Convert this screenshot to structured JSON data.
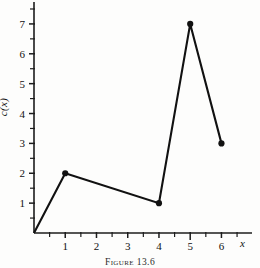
{
  "figure": {
    "caption_prefix": "Figure",
    "caption_number": "13.6",
    "caption_full": "Figure 13.6"
  },
  "axes": {
    "x_axis_name": "x",
    "y_axis_name": "c(x)",
    "x_ticks": [
      "1",
      "2",
      "3",
      "4",
      "5",
      "6"
    ],
    "y_ticks": [
      "1",
      "2",
      "3",
      "4",
      "5",
      "6",
      "7"
    ],
    "x_tick_values": [
      1,
      2,
      3,
      4,
      5,
      6
    ],
    "y_tick_values": [
      1,
      2,
      3,
      4,
      5,
      6,
      7
    ],
    "x_minor_step": 0.5,
    "y_minor_step": 0.5,
    "xlim": [
      0,
      6.85
    ],
    "ylim": [
      0,
      7.6
    ]
  },
  "chart_data": {
    "type": "line",
    "xlabel": "x",
    "ylabel": "c(x)",
    "x": [
      0,
      1,
      4,
      5,
      6
    ],
    "values": [
      0,
      2,
      1,
      7,
      3
    ],
    "points": [
      {
        "x": 0,
        "y": 0,
        "marker": false
      },
      {
        "x": 1,
        "y": 2,
        "marker": true
      },
      {
        "x": 4,
        "y": 1,
        "marker": true
      },
      {
        "x": 5,
        "y": 7,
        "marker": true
      },
      {
        "x": 6,
        "y": 3,
        "marker": true
      }
    ],
    "xlim": [
      0,
      6.85
    ],
    "ylim": [
      0,
      7.6
    ],
    "grid": false,
    "legend": null,
    "series": [
      {
        "name": "c(x)",
        "values": [
          0,
          2,
          1,
          7,
          3
        ]
      }
    ],
    "colors": {
      "line": "#111111",
      "marker": "#111111",
      "axis": "#1c1c1c",
      "background": "#fdfdfc"
    }
  }
}
